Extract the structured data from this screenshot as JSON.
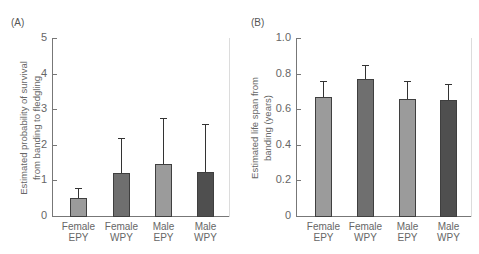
{
  "chart_data": [
    {
      "type": "bar",
      "panel_label": "(A)",
      "title": "",
      "ylabel_lines": [
        "Estimated probability of survival",
        "from banding to fledgling"
      ],
      "xlabel": "",
      "categories": [
        {
          "line1": "Female",
          "line2": "EPY"
        },
        {
          "line1": "Female",
          "line2": "WPY"
        },
        {
          "line1": "Male",
          "line2": "EPY"
        },
        {
          "line1": "Male",
          "line2": "WPY"
        }
      ],
      "values": [
        0.5,
        1.2,
        1.45,
        1.24
      ],
      "error_upper": [
        0.8,
        2.2,
        2.75,
        2.58
      ],
      "ylim": [
        0,
        5
      ],
      "yticks": [
        "0",
        "1",
        "2",
        "3",
        "4",
        "5"
      ],
      "bar_colors": [
        "#9b9b9b",
        "#6f6f6f",
        "#9b9b9b",
        "#4f4f4f"
      ],
      "grid": false
    },
    {
      "type": "bar",
      "panel_label": "(B)",
      "title": "",
      "ylabel_lines": [
        "Estimated life span from",
        "banding (years)"
      ],
      "xlabel": "",
      "categories": [
        {
          "line1": "Female",
          "line2": "EPY"
        },
        {
          "line1": "Female",
          "line2": "WPY"
        },
        {
          "line1": "Male",
          "line2": "EPY"
        },
        {
          "line1": "Male",
          "line2": "WPY"
        }
      ],
      "values": [
        0.67,
        0.77,
        0.655,
        0.65
      ],
      "error_upper": [
        0.76,
        0.85,
        0.76,
        0.74
      ],
      "ylim": [
        0,
        1.0
      ],
      "yticks": [
        "0",
        "0.2",
        "0.4",
        "0.6",
        "0.8",
        "1.0"
      ],
      "bar_colors": [
        "#9b9b9b",
        "#6f6f6f",
        "#9b9b9b",
        "#4f4f4f"
      ],
      "grid": false
    }
  ]
}
